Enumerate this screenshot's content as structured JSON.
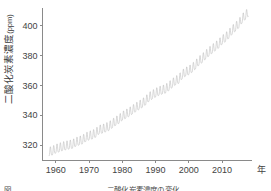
{
  "figure": {
    "y_axis_title_main": "二酸化炭素濃度",
    "y_axis_title_unit": "(ppm)",
    "x_axis_unit": "年",
    "caption": "図 　　　　　　　　　　　　　二酸化炭素濃度の変化"
  },
  "chart_data": {
    "type": "line",
    "title": "",
    "xlabel": "年",
    "ylabel": "二酸化炭素濃度 (ppm)",
    "xlim": [
      1956,
      2019
    ],
    "ylim": [
      310,
      412
    ],
    "xticks": [
      1960,
      1970,
      1980,
      1990,
      2000,
      2010
    ],
    "yticks": [
      320,
      340,
      360,
      380,
      400
    ],
    "grid": false,
    "legend": null,
    "line_color": "#bfbfbf",
    "series": [
      {
        "name": "大気中二酸化炭素濃度",
        "description": "月平均値。季節変動を含む年周期の鋸歯状振動と長期的な増加傾向。",
        "seasonal_amplitude_ppm": 6,
        "x": [
          1958,
          1959,
          1960,
          1961,
          1962,
          1963,
          1964,
          1965,
          1966,
          1967,
          1968,
          1969,
          1970,
          1971,
          1972,
          1973,
          1974,
          1975,
          1976,
          1977,
          1978,
          1979,
          1980,
          1981,
          1982,
          1983,
          1984,
          1985,
          1986,
          1987,
          1988,
          1989,
          1990,
          1991,
          1992,
          1993,
          1994,
          1995,
          1996,
          1997,
          1998,
          1999,
          2000,
          2001,
          2002,
          2003,
          2004,
          2005,
          2006,
          2007,
          2008,
          2009,
          2010,
          2011,
          2012,
          2013,
          2014,
          2015,
          2016,
          2017
        ],
        "values": [
          315.0,
          315.6,
          316.9,
          317.6,
          318.5,
          319.0,
          319.6,
          320.0,
          321.4,
          322.2,
          323.0,
          324.6,
          325.7,
          326.3,
          327.5,
          329.7,
          330.2,
          331.1,
          332.0,
          333.8,
          335.4,
          336.8,
          338.8,
          340.1,
          341.4,
          343.0,
          344.6,
          346.0,
          347.4,
          349.2,
          351.6,
          353.1,
          354.4,
          355.6,
          356.4,
          357.1,
          358.8,
          360.8,
          362.6,
          363.7,
          366.7,
          368.4,
          369.5,
          371.1,
          373.2,
          375.8,
          377.5,
          379.8,
          381.9,
          383.8,
          385.6,
          387.4,
          389.9,
          391.6,
          393.8,
          396.5,
          398.6,
          400.8,
          404.2,
          406.5
        ]
      }
    ]
  }
}
